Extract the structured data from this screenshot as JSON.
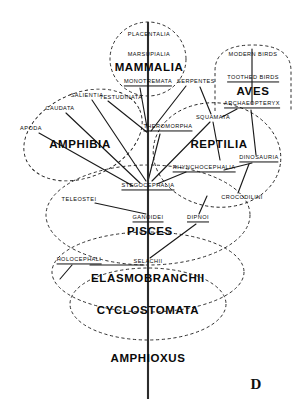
{
  "figure": {
    "corner_letter": "D",
    "canvas": {
      "width": 294,
      "height": 419
    }
  },
  "nodes": [
    {
      "id": "placentalia",
      "label": "PLACENTALIA",
      "x": 149,
      "y": 35,
      "size": "minor",
      "extinct": false
    },
    {
      "id": "marsupialia",
      "label": "MARSUPIALIA",
      "x": 149,
      "y": 55,
      "size": "minor",
      "extinct": false
    },
    {
      "id": "mammalia",
      "label": "MAMMALIA",
      "x": 149,
      "y": 68,
      "size": "major",
      "extinct": false
    },
    {
      "id": "monotremata",
      "label": "MONOTREMATA",
      "x": 148,
      "y": 83,
      "size": "minor",
      "extinct": true
    },
    {
      "id": "modern-birds",
      "label": "MODERN BIRDS",
      "x": 253,
      "y": 55,
      "size": "minor",
      "extinct": false
    },
    {
      "id": "toothed-birds",
      "label": "TOOTHED BIRDS",
      "x": 253,
      "y": 79,
      "size": "minor",
      "extinct": true
    },
    {
      "id": "aves",
      "label": "AVES",
      "x": 253,
      "y": 92,
      "size": "major",
      "extinct": false
    },
    {
      "id": "archaeopteryx",
      "label": "ARCHAEOPTERYX",
      "x": 252,
      "y": 105,
      "size": "minor",
      "extinct": true
    },
    {
      "id": "serpentes",
      "label": "SERPENTES",
      "x": 196,
      "y": 82,
      "size": "minor",
      "extinct": false
    },
    {
      "id": "squamata",
      "label": "SQUAMATA",
      "x": 213,
      "y": 118,
      "size": "minor",
      "extinct": false
    },
    {
      "id": "testudinata",
      "label": "TESTUDINATA",
      "x": 121,
      "y": 98,
      "size": "minor",
      "extinct": false
    },
    {
      "id": "salientia",
      "label": "SALIENTIA",
      "x": 87,
      "y": 96,
      "size": "minor",
      "extinct": false
    },
    {
      "id": "caudata",
      "label": "CAUDATA",
      "x": 60,
      "y": 109,
      "size": "minor",
      "extinct": false
    },
    {
      "id": "apoda",
      "label": "APODA",
      "x": 31,
      "y": 129,
      "size": "minor",
      "extinct": false
    },
    {
      "id": "amphibia",
      "label": "AMPHIBIA",
      "x": 80,
      "y": 145,
      "size": "major",
      "extinct": false
    },
    {
      "id": "theromorpha",
      "label": "THEROMORPHA",
      "x": 168,
      "y": 128,
      "size": "minor",
      "extinct": true
    },
    {
      "id": "reptilia",
      "label": "REPTILIA",
      "x": 219,
      "y": 145,
      "size": "major",
      "extinct": false
    },
    {
      "id": "dinosauria",
      "label": "DINOSAURIA",
      "x": 259,
      "y": 159,
      "size": "minor",
      "extinct": true
    },
    {
      "id": "rhynchocephalia",
      "label": "RHYNCHOCEPHALIA",
      "x": 204,
      "y": 169,
      "size": "minor",
      "extinct": true
    },
    {
      "id": "crocodilini",
      "label": "CROCODILINI",
      "x": 242,
      "y": 198,
      "size": "minor",
      "extinct": false
    },
    {
      "id": "stegocephalia",
      "label": "STEGOCEPHALIA",
      "x": 148,
      "y": 187,
      "size": "minor",
      "extinct": true
    },
    {
      "id": "teleostei",
      "label": "TELEOSTEI",
      "x": 79,
      "y": 200,
      "size": "minor",
      "extinct": false
    },
    {
      "id": "ganoidei",
      "label": "GANOIDEI",
      "x": 148,
      "y": 219,
      "size": "minor",
      "extinct": true
    },
    {
      "id": "dipnoi",
      "label": "DIPNOI",
      "x": 198,
      "y": 219,
      "size": "minor",
      "extinct": true
    },
    {
      "id": "pisces",
      "label": "PISCES",
      "x": 150,
      "y": 232,
      "size": "major",
      "extinct": false
    },
    {
      "id": "holocephali",
      "label": "HOLOCEPHALI",
      "x": 79,
      "y": 261,
      "size": "minor",
      "extinct": true
    },
    {
      "id": "selachii",
      "label": "SELACHII",
      "x": 148,
      "y": 262,
      "size": "minor",
      "extinct": false
    },
    {
      "id": "elasmobranchii",
      "label": "ELASMOBRANCHII",
      "x": 148,
      "y": 279,
      "size": "major",
      "extinct": false
    },
    {
      "id": "cyclostomata",
      "label": "CYCLOSTOMATA",
      "x": 148,
      "y": 311,
      "size": "major",
      "extinct": false
    },
    {
      "id": "amphioxus",
      "label": "AMPHIOXUS",
      "x": 148,
      "y": 359,
      "size": "major",
      "extinct": false
    }
  ],
  "trunk": {
    "id": "main-stem",
    "x": 148,
    "y_top": 22,
    "y_bottom": 399
  },
  "branches": [
    {
      "id": "b-mammalia-stem",
      "x1": 148,
      "y1": 82,
      "x2": 148,
      "y2": 28
    },
    {
      "id": "b-aves-stem",
      "x1": 252,
      "y1": 104,
      "x2": 252,
      "y2": 49
    },
    {
      "id": "b-theromorpha-mammal",
      "x1": 148,
      "y1": 133,
      "x2": 140,
      "y2": 88
    },
    {
      "id": "b-theromorpha-left",
      "x1": 148,
      "y1": 133,
      "x2": 108,
      "y2": 101
    },
    {
      "id": "b-theromorpha-up",
      "x1": 151,
      "y1": 131,
      "x2": 186,
      "y2": 86
    },
    {
      "id": "b-stego-theromorpha",
      "x1": 148,
      "y1": 181,
      "x2": 160,
      "y2": 134
    },
    {
      "id": "b-stego-reptilia",
      "x1": 152,
      "y1": 181,
      "x2": 210,
      "y2": 122
    },
    {
      "id": "b-stego-salientia",
      "x1": 146,
      "y1": 181,
      "x2": 92,
      "y2": 100
    },
    {
      "id": "b-stego-caudata",
      "x1": 140,
      "y1": 183,
      "x2": 66,
      "y2": 113
    },
    {
      "id": "b-stego-apoda",
      "x1": 133,
      "y1": 186,
      "x2": 39,
      "y2": 133
    },
    {
      "id": "b-squamata-serpentes",
      "x1": 211,
      "y1": 114,
      "x2": 200,
      "y2": 87
    },
    {
      "id": "b-squamata-down",
      "x1": 213,
      "y1": 122,
      "x2": 220,
      "y2": 160
    },
    {
      "id": "b-archaeo-squamata",
      "x1": 237,
      "y1": 109,
      "x2": 222,
      "y2": 117
    },
    {
      "id": "b-dino-rhyncho",
      "x1": 252,
      "y1": 163,
      "x2": 224,
      "y2": 170
    },
    {
      "id": "b-dino-croc",
      "x1": 249,
      "y1": 164,
      "x2": 238,
      "y2": 193
    },
    {
      "id": "b-dino-archaeo",
      "x1": 256,
      "y1": 155,
      "x2": 251,
      "y2": 110
    },
    {
      "id": "b-rhyncho-stego",
      "x1": 186,
      "y1": 172,
      "x2": 157,
      "y2": 184
    },
    {
      "id": "b-ganoidei-teleostei",
      "x1": 146,
      "y1": 214,
      "x2": 95,
      "y2": 203
    },
    {
      "id": "b-ganoidei-stego",
      "x1": 148,
      "y1": 214,
      "x2": 148,
      "y2": 192
    },
    {
      "id": "b-dipnoi-selachii",
      "x1": 196,
      "y1": 224,
      "x2": 150,
      "y2": 258
    },
    {
      "id": "b-dipnoi-up",
      "x1": 199,
      "y1": 214,
      "x2": 207,
      "y2": 196
    },
    {
      "id": "b-selachii-holo",
      "x1": 144,
      "y1": 265,
      "x2": 90,
      "y2": 265
    },
    {
      "id": "b-holo-down",
      "x1": 72,
      "y1": 265,
      "x2": 60,
      "y2": 279
    }
  ],
  "groups": [
    {
      "id": "group-mammalia",
      "label_ref": "mammalia",
      "type": "ellipse",
      "cx": 148,
      "cy": 59,
      "rx": 38,
      "ry": 37
    },
    {
      "id": "group-aves",
      "label_ref": "aves",
      "type": "capsule",
      "x": 215,
      "y": 45,
      "w": 76,
      "h": 66,
      "arc": 26
    },
    {
      "id": "group-amphibia",
      "label_ref": "amphibia",
      "type": "ellipse",
      "cx": 83,
      "cy": 135,
      "rx": 62,
      "ry": 42,
      "rotate": -24
    },
    {
      "id": "group-reptilia",
      "label_ref": "reptilia",
      "type": "ellipse",
      "cx": 217,
      "cy": 155,
      "rx": 64,
      "ry": 52,
      "rotate": 8
    },
    {
      "id": "group-pisces",
      "label_ref": "pisces",
      "type": "ellipse",
      "cx": 148,
      "cy": 215,
      "rx": 102,
      "ry": 50
    },
    {
      "id": "group-elasmobranchii",
      "label_ref": "elasmobranchii",
      "type": "ellipse",
      "cx": 148,
      "cy": 272,
      "rx": 96,
      "ry": 40
    },
    {
      "id": "group-cyclostomata",
      "label_ref": "cyclostomata",
      "type": "ellipse",
      "cx": 148,
      "cy": 304,
      "rx": 78,
      "ry": 36
    }
  ]
}
